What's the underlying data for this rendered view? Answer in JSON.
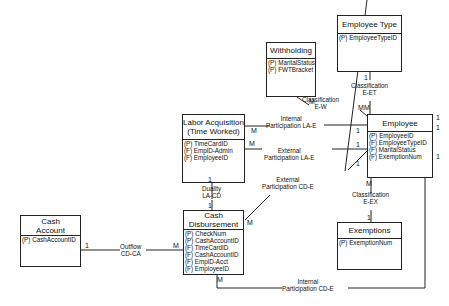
{
  "entities": {
    "withholding": {
      "title": [
        "Withholding"
      ],
      "attrs": [
        "(P) MaritalStatus",
        "(P) FWTBracket"
      ]
    },
    "employee_type": {
      "title": [
        "Employee Type"
      ],
      "attrs": [
        "(P) EmployeeTypeID"
      ]
    },
    "labor_acquisition": {
      "title": [
        "Labor Acquisition",
        "(Time Worked)"
      ],
      "attrs": [
        "(P) TimeCardID",
        "(F) EmplD-Admin",
        "(F) EmployeeID"
      ]
    },
    "employee": {
      "title": [
        "Employee"
      ],
      "attrs": [
        "(P) EmployeeID",
        "(F) EmployeeTypeID",
        "(F) MaritalStatus",
        "(F) ExemptionNum"
      ]
    },
    "exemptions": {
      "title": [
        "Exemptions"
      ],
      "attrs": [
        "(P) ExemptionNum"
      ]
    },
    "cash_disbursement": {
      "title": [
        "Cash",
        "Disbursement"
      ],
      "attrs": [
        "(P) CheckNum",
        "(P) CashAccountID",
        "(F) TimeCardID",
        "(F) CashAccountID",
        "(F) EmplD-Acct",
        "(F) EmployeeID"
      ]
    },
    "cash_account": {
      "title": [
        "Cash",
        "Account"
      ],
      "attrs": [
        "(P) CashAccountID"
      ]
    }
  },
  "relationships": {
    "classification_ew": {
      "lines": [
        "Classification",
        "E-W"
      ]
    },
    "classification_eet": {
      "lines": [
        "Classification",
        "E-ET"
      ]
    },
    "internal_la_e": {
      "lines": [
        "Internal",
        "Participation LA-E"
      ]
    },
    "external_la_e": {
      "lines": [
        "External",
        "Participation LA-E"
      ]
    },
    "external_cd_e": {
      "lines": [
        "External",
        "Participation CD-E"
      ]
    },
    "duality_la_cd": {
      "lines": [
        "Duality",
        "LA-CD"
      ]
    },
    "classification_eex": {
      "lines": [
        "Classification",
        "E-EX"
      ]
    },
    "outflow_cd_ca": {
      "lines": [
        "Outflow",
        "CD-CA"
      ]
    },
    "internal_cd_e": {
      "lines": [
        "Internal",
        "Participation CD-E"
      ]
    }
  },
  "cardinalities": {
    "ew_w": "M",
    "ew_e": "M",
    "eet_et": "1",
    "eet_e": "M",
    "lae_int_la": "M",
    "lae_int_e": "1",
    "lae_ext_la": "M",
    "lae_ext_e": "1",
    "cde_ext_e": "1",
    "cde_ext_cd": "M",
    "lacd_la": "1",
    "lacd_cd": "1",
    "eex_e": "M",
    "eex_ex": "1",
    "cdca_ca": "1",
    "cdca_cd": "M",
    "cde_int_cd": "M",
    "e_right_1": "1",
    "e_right_2": "1",
    "e_right_3": "1"
  }
}
